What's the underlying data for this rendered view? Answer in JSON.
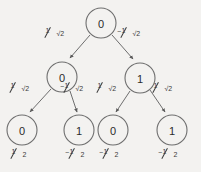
{
  "diagram": {
    "type": "binary-probability-tree",
    "title": "",
    "background_color": "#f3f2f0",
    "stroke_color": "#6e6e6e",
    "text_color": "#2b2b2b",
    "nodes": [
      {
        "id": "root",
        "label": "0",
        "level": 0,
        "cx": 101,
        "cy": 23,
        "r": 15
      },
      {
        "id": "n-l",
        "label": "0",
        "level": 1,
        "cx": 62,
        "cy": 77,
        "r": 15
      },
      {
        "id": "n-r",
        "label": "1",
        "level": 1,
        "cx": 140,
        "cy": 78,
        "r": 15
      },
      {
        "id": "n-ll",
        "label": "0",
        "level": 2,
        "cx": 22,
        "cy": 130,
        "r": 15
      },
      {
        "id": "n-lr",
        "label": "1",
        "level": 2,
        "cx": 79,
        "cy": 130,
        "r": 15
      },
      {
        "id": "n-rl",
        "label": "0",
        "level": 2,
        "cx": 113,
        "cy": 130,
        "r": 15
      },
      {
        "id": "n-rr",
        "label": "1",
        "level": 2,
        "cx": 172,
        "cy": 130,
        "r": 15
      }
    ],
    "edges": [
      {
        "id": "e-root-l",
        "from": "root",
        "to": "n-l",
        "sign": "",
        "numerator": "1",
        "denominator": "√2",
        "label": "1/√2",
        "label_x": 47,
        "label_y": 30
      },
      {
        "id": "e-root-r",
        "from": "root",
        "to": "n-r",
        "sign": "−",
        "numerator": "1",
        "denominator": "√2",
        "label": "-1/√2",
        "label_x": 120,
        "label_y": 30
      },
      {
        "id": "e-l-ll",
        "from": "n-l",
        "to": "n-ll",
        "sign": "",
        "numerator": "1",
        "denominator": "√2",
        "label": "1/√2",
        "label_x": 12,
        "label_y": 85
      },
      {
        "id": "e-l-lr",
        "from": "n-l",
        "to": "n-lr",
        "sign": "−",
        "numerator": "1",
        "denominator": "√2",
        "label": "-1/√2",
        "label_x": 62,
        "label_y": 85
      },
      {
        "id": "e-r-rl",
        "from": "n-r",
        "to": "n-rl",
        "sign": "",
        "numerator": "1",
        "denominator": "√2",
        "label": "1/√2",
        "label_x": 98,
        "label_y": 85
      },
      {
        "id": "e-r-rr",
        "from": "n-r",
        "to": "n-rr",
        "sign": "",
        "numerator": "1",
        "denominator": "√2",
        "label": "1/√2",
        "label_x": 155,
        "label_y": 85
      }
    ],
    "leaf_values": [
      {
        "id": "v-ll",
        "node": "n-ll",
        "sign": "",
        "numerator": "1",
        "denominator": "2",
        "label": "1/2",
        "x": 12,
        "y": 150
      },
      {
        "id": "v-lr",
        "node": "n-lr",
        "sign": "−",
        "numerator": "1",
        "denominator": "2",
        "label": "-1/2",
        "x": 66,
        "y": 150
      },
      {
        "id": "v-rl",
        "node": "n-rl",
        "sign": "−",
        "numerator": "1",
        "denominator": "2",
        "label": "-1/2",
        "x": 100,
        "y": 150
      },
      {
        "id": "v-rr",
        "node": "n-rr",
        "sign": "−",
        "numerator": "1",
        "denominator": "2",
        "label": "-1/2",
        "x": 159,
        "y": 150
      }
    ]
  }
}
